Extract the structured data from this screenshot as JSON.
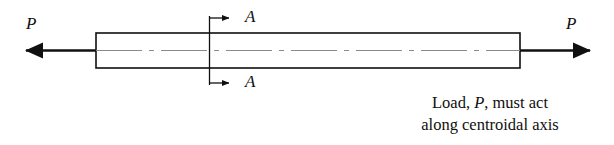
{
  "figure": {
    "background_color": "#ffffff",
    "line_color": "#101010",
    "centerline_color": "#7a7a7a",
    "width": 614,
    "height": 145
  },
  "bar": {
    "name": "prismatic-bar",
    "left": 96,
    "right": 520,
    "top": 33,
    "bottom": 68
  },
  "loads": [
    {
      "id": "load-left",
      "label": "P",
      "direction": "left",
      "tip_x": 22,
      "tail_x": 96,
      "y": 50
    },
    {
      "id": "load-right",
      "label": "P",
      "direction": "right",
      "tail_x": 520,
      "tip_x": 594,
      "y": 50
    }
  ],
  "section_cut": {
    "name": "section-a-a",
    "line_x": 209,
    "line_top": 16,
    "line_bottom": 85,
    "arrow_tip_x": 232,
    "top_arrow_y": 18,
    "bottom_arrow_y": 83,
    "label_top": "A",
    "label_bottom": "A"
  },
  "centroidal_axis": {
    "name": "centroidal-axis-centerline",
    "y": 50,
    "style": "dash-dot"
  },
  "caption": {
    "line1_prefix": "Load, ",
    "line1_variable": "P",
    "line1_suffix": ", must act",
    "line2": "along centroidal axis"
  }
}
